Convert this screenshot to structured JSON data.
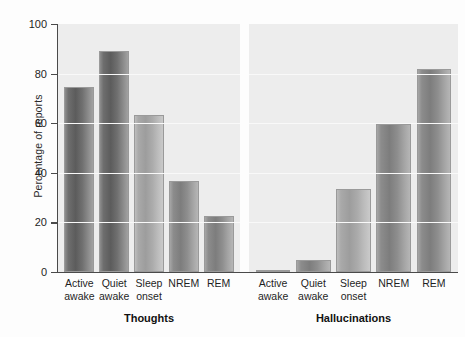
{
  "chart_data": {
    "type": "bar",
    "title": "",
    "subtitle": "",
    "xlabel": "",
    "ylabel": "Percentage of reports",
    "ylim": [
      0,
      100
    ],
    "yticks": [
      0,
      20,
      40,
      60,
      80,
      100
    ],
    "grid": true,
    "legend": "none",
    "categories": [
      "Active awake",
      "Quiet awake",
      "Sleep onset",
      "NREM",
      "REM"
    ],
    "category_lines": [
      [
        "Active",
        "awake"
      ],
      [
        "Quiet",
        "awake"
      ],
      [
        "Sleep",
        "onset"
      ],
      [
        "NREM",
        ""
      ],
      [
        "REM",
        ""
      ]
    ],
    "panels": [
      {
        "name": "Thoughts",
        "values": [
          74.5,
          89,
          63.5,
          36.5,
          22.5
        ]
      },
      {
        "name": "Hallucinations",
        "values": [
          1,
          5,
          33.5,
          59.5,
          82
        ]
      }
    ],
    "series": [
      {
        "name": "Thoughts",
        "values": [
          74.5,
          89,
          63.5,
          36.5,
          22.5
        ]
      },
      {
        "name": "Hallucinations",
        "values": [
          1,
          5,
          33.5,
          59.5,
          82
        ]
      }
    ],
    "colors": {
      "panel_background": "#ededed",
      "gridline": "#f9f9f9",
      "axis": "#4a4a4a",
      "bar_dark": "#5c5c5c",
      "bar_mid": "#7d7d7d",
      "bar_light": "#9d9d9d",
      "text": "#1f1f1f"
    }
  }
}
